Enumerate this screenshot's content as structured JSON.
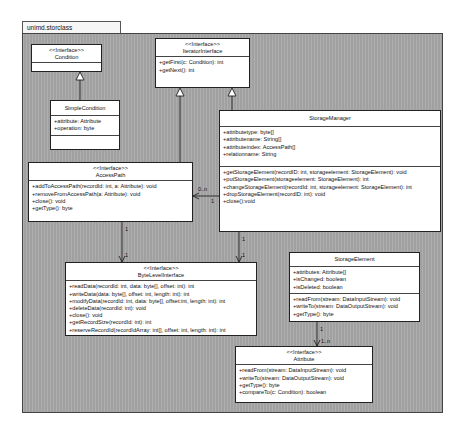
{
  "package": {
    "name": "unimd.storclass"
  },
  "classes": {
    "condition": {
      "stereotype": "<<Interface>>",
      "name": "Condition"
    },
    "iterator": {
      "stereotype": "<<Interface>>",
      "name": "IteratorInterface",
      "operations": [
        "+getFirst(c: Condition): int",
        "+getNext(): int"
      ]
    },
    "simplecondition": {
      "name": "SimpleCondition",
      "attributes": [
        "+attribute: Attribute",
        "+operation: byte"
      ]
    },
    "storagemanager": {
      "name": "StorageManager",
      "attributes": [
        "+attributetype: byte[]",
        "+attributename: String[]",
        "+attributeindex: AccessPath[]",
        "+relationname: String"
      ],
      "operations": [
        "+getStorageElement(recordID: int, storageelement: StorageElement): void",
        "+putStorageElement(storageelement: StorageElement): int",
        "+changeStorageElement(recordId: int, storageelement: StorageElement): int",
        "+dropStorageElement(recordID: int): void",
        "+close():void"
      ]
    },
    "accesspath": {
      "stereotype": "<<Interface>>",
      "name": "AccessPath",
      "operations": [
        "+addToAccessPath(recordId: int, a: Attribute): void",
        "+removeFromAccessPath(a: Attribute): void",
        "+close(): void",
        "+getType(): byte"
      ]
    },
    "bytelevel": {
      "stereotype": "<<Interface>>",
      "name": "ByteLevelInterface",
      "operations": [
        "+readData(recordId: int, data: byte[], offset: int): int",
        "+writeData(data: byte[], offset: int, length: int): int",
        "+modifyData(recordId: int, data: byte[], offset:int, length: int): int",
        "+deleteData(recordId: int): void",
        "+close(): void",
        "+getRecordSize(recordId: int): int",
        "+reserveRecordId(recordIdArray: int[], offset: int, length: int): int"
      ]
    },
    "storageelement": {
      "name": "StorageElement",
      "attributes": [
        "+attributes: Attribute[]",
        "+isChanged: boolean",
        "+isDeleted: boolean"
      ],
      "operations": [
        "+readFrom(stream: DataInputStream): void",
        "+writeTo(stream: DataOutputStream): void",
        "+getType(): byte"
      ]
    },
    "attribute": {
      "stereotype": "<<Interface>>",
      "name": "Attribute",
      "operations": [
        "+readFrom(stream: DataInputStream): void",
        "+writeTo(stream: DataOutputStream): void",
        "+getType(): byte",
        "+compareTo(c: Condition): boolean"
      ]
    }
  },
  "multiplicities": {
    "sm_ap_far": "0..n",
    "sm_ap_near": "1",
    "ap_bl_top": "1",
    "ap_bl_bottom": "1",
    "sm_bl_top": "1",
    "sm_bl_bottom": "1",
    "se_at_top": "1",
    "se_at_bottom": "1..n"
  }
}
